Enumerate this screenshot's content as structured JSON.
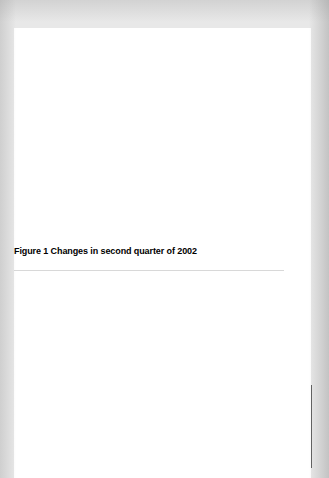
{
  "figure": {
    "caption": "Figure 1 Changes in second quarter of 2002",
    "ylabel_line1": "Change in expenditure",
    "ylabel_line2": "(billions of dollars per year)"
  },
  "colors": {
    "inventories": "#b9b9b9",
    "exports": "#4a4a4a",
    "government": "#2e2e2e",
    "investment": "#565656",
    "consumption": "#636363",
    "imports": "#5e5e5e",
    "real_gdp": "#5e5e5e",
    "page_background": "#e8e8e8",
    "card_background": "#ffffff",
    "text": "#000000",
    "bar_label_text": "#ffffff"
  },
  "chart_data": [
    {
      "type": "bar",
      "title": "Figure 1 Changes in second quarter of 2002",
      "xlabel": "",
      "ylabel": "Change in expenditure (billions of dollars per year)",
      "ylim": [
        0,
        30
      ],
      "yticks": [
        0,
        5,
        10,
        15,
        20,
        25,
        30
      ],
      "ytick_labels": [
        "0",
        "5",
        "10",
        "15",
        "20",
        "25",
        "30"
      ],
      "grid": false,
      "legend": "none",
      "bars": [
        {
          "name": "expenditure-components",
          "stacked": true,
          "segments": [
            {
              "label": "Consumption",
              "start": 0,
              "end": 7.5,
              "value": 7.5,
              "color_key": "consumption"
            },
            {
              "label": "Investment",
              "start": 7.5,
              "end": 10.5,
              "value": 3.0,
              "color_key": "investment"
            },
            {
              "label": "Government",
              "start": 10.5,
              "end": 12.0,
              "value": 1.5,
              "color_key": "government"
            },
            {
              "label": "Exports",
              "start": 12.0,
              "end": 13.5,
              "value": 1.5,
              "color_key": "exports"
            },
            {
              "label": "Change in inventories",
              "start": 13.5,
              "end": 25.5,
              "value": 12.0,
              "color_key": "inventories"
            }
          ]
        },
        {
          "name": "minus-imports",
          "stacked": false,
          "segments": [
            {
              "label": "Minus imports",
              "start": 11.0,
              "end": 26.0,
              "value": 15.0,
              "color_key": "imports"
            }
          ]
        },
        {
          "name": "real-gdp",
          "stacked": false,
          "segments": [
            {
              "label": "Real GDP",
              "start": 0,
              "end": 11.0,
              "value": 11.0,
              "color_key": "real_gdp"
            }
          ]
        }
      ]
    },
    {
      "type": "bar",
      "title": "",
      "xlabel": "",
      "ylabel": "Change in expenditure (billions of dollars per year)",
      "ylim": [
        0,
        30
      ],
      "yticks": [
        0,
        5,
        10,
        15,
        20,
        25,
        30
      ],
      "ytick_labels": [
        "0",
        "5",
        "10",
        "15",
        "20",
        "25",
        "30"
      ],
      "grid": false,
      "legend": "none",
      "bars": [
        {
          "name": "expenditure-components",
          "stacked": true,
          "segments": [
            {
              "label": "Consumption",
              "start": 0,
              "end": 3.0,
              "value": 3.0,
              "color_key": "consumption"
            },
            {
              "label": "Investment",
              "start": 3.0,
              "end": 6.5,
              "value": 3.5,
              "color_key": "investment"
            },
            {
              "label": "Government",
              "start": 6.5,
              "end": 10.0,
              "value": 3.5,
              "color_key": "government"
            },
            {
              "label": "Exports",
              "start": 10.0,
              "end": 14.5,
              "value": 4.5,
              "color_key": "exports"
            },
            {
              "label": "Change in inventories",
              "start": 14.5,
              "end": 19.0,
              "value": 4.5,
              "color_key": "inventories"
            }
          ]
        },
        {
          "name": "minus-imports",
          "stacked": false,
          "segments": [
            {
              "label": "Minus imports",
              "start": 16.5,
              "end": 20.0,
              "value": 3.5,
              "color_key": "imports"
            }
          ]
        },
        {
          "name": "real-gdp",
          "stacked": false,
          "segments": [
            {
              "label": "Real GDP",
              "start": 0,
              "end": 16.0,
              "value": 16.0,
              "color_key": "real_gdp"
            }
          ]
        }
      ]
    }
  ]
}
